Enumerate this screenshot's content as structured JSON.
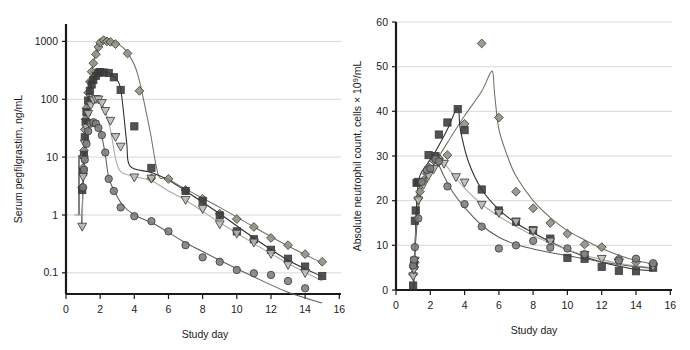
{
  "figure": {
    "panels": [
      {
        "id": "serum-pegfilgrastim",
        "ylabel": "Serum pegfilgrastim, ng/mL",
        "xlabel": "Study day",
        "yticks": [
          "1000",
          "100",
          "10",
          "1",
          "0.1"
        ],
        "xticks": [
          "0",
          "2",
          "4",
          "6",
          "8",
          "10",
          "12",
          "14",
          "16"
        ]
      },
      {
        "id": "absolute-neutrophil-count",
        "ylabel_part1": "Absolute neutrophil count, cells × 10",
        "ylabel_sup": "9",
        "ylabel_part2": "/mL",
        "xlabel": "Study day",
        "yticks": [
          "60",
          "50",
          "40",
          "30",
          "20",
          "10",
          "0"
        ],
        "xticks": [
          "0",
          "2",
          "4",
          "6",
          "8",
          "10",
          "12",
          "14",
          "16"
        ]
      }
    ]
  },
  "colors": {
    "axis": "#1a1a1a",
    "grid": "#d8d8d8",
    "series_diamond": "#8d9080",
    "series_square": "#3a3a3a",
    "series_triangle": "#b9bbb0",
    "series_circle": "#7d7d7d",
    "line_diamond": "#6f7163",
    "line_square": "#2b2b2b",
    "line_triangle": "#a8aa9e",
    "line_circle": "#5d5d5d"
  },
  "chart_data": [
    {
      "type": "scatter",
      "title": "",
      "xlabel": "Study day",
      "ylabel": "Serum pegfilgrastim, ng/mL",
      "xlim": [
        0,
        16
      ],
      "ylim": [
        0.04,
        2000
      ],
      "yscale": "log",
      "xscale": "linear",
      "grid": true,
      "legend": "none",
      "xticks": [
        0,
        2,
        4,
        6,
        8,
        10,
        12,
        14,
        16
      ],
      "yticks": [
        0.1,
        1,
        10,
        100,
        1000
      ],
      "series": [
        {
          "name": "Dose group 1 (highest) - diamond",
          "marker": "diamond",
          "color": "#8d9080",
          "points": [
            [
              0.95,
              3.0
            ],
            [
              1.0,
              6.5
            ],
            [
              1.05,
              13
            ],
            [
              1.1,
              30
            ],
            [
              1.15,
              45
            ],
            [
              1.2,
              70
            ],
            [
              1.3,
              130
            ],
            [
              1.4,
              200
            ],
            [
              1.5,
              300
            ],
            [
              1.6,
              420
            ],
            [
              1.75,
              600
            ],
            [
              1.9,
              800
            ],
            [
              2.0,
              950
            ],
            [
              2.2,
              1050
            ],
            [
              2.4,
              1000
            ],
            [
              2.6,
              980
            ],
            [
              2.9,
              900
            ],
            [
              3.6,
              620
            ],
            [
              4.3,
              140
            ],
            [
              5.0,
              4.3
            ],
            [
              6.0,
              4.2
            ],
            [
              7.0,
              2.7
            ],
            [
              8.0,
              1.9
            ],
            [
              9.0,
              1.05
            ],
            [
              10.0,
              0.85
            ],
            [
              11.0,
              0.62
            ],
            [
              12.0,
              0.4
            ],
            [
              13.0,
              0.3
            ],
            [
              14.0,
              0.21
            ],
            [
              15.0,
              0.155
            ]
          ],
          "fit_curve": "rise to ~1000 ng/mL at day 2-3, steep drop by day 5-6, then log-linear decline to 0.15"
        },
        {
          "name": "Dose group 2 - square",
          "marker": "square",
          "color": "#3a3a3a",
          "points": [
            [
              0.95,
              2.7
            ],
            [
              1.0,
              5.5
            ],
            [
              1.05,
              11
            ],
            [
              1.1,
              22
            ],
            [
              1.15,
              40
            ],
            [
              1.2,
              60
            ],
            [
              1.3,
              95
            ],
            [
              1.4,
              140
            ],
            [
              1.5,
              180
            ],
            [
              1.6,
              215
            ],
            [
              1.75,
              255
            ],
            [
              1.9,
              290
            ],
            [
              2.0,
              295
            ],
            [
              2.2,
              290
            ],
            [
              2.5,
              285
            ],
            [
              2.8,
              240
            ],
            [
              3.2,
              145
            ],
            [
              4.0,
              34
            ],
            [
              5.0,
              6.5
            ],
            [
              7.0,
              2.6
            ],
            [
              8.0,
              1.75
            ],
            [
              9.0,
              0.98
            ],
            [
              10.0,
              0.52
            ],
            [
              11.0,
              0.38
            ],
            [
              12.0,
              0.25
            ],
            [
              13.0,
              0.175
            ],
            [
              14.0,
              0.128
            ],
            [
              15.0,
              0.088
            ]
          ],
          "fit_curve": "peak ~300 ng/mL at day 2, drop after day 3, log-linear decline to 0.09"
        },
        {
          "name": "Dose group 3 - triangle",
          "marker": "triangle-down",
          "color": "#b9bbb0",
          "points": [
            [
              0.95,
              0.62
            ],
            [
              1.0,
              4.5
            ],
            [
              1.05,
              9
            ],
            [
              1.1,
              17
            ],
            [
              1.2,
              32
            ],
            [
              1.3,
              55
            ],
            [
              1.45,
              78
            ],
            [
              1.6,
              95
            ],
            [
              1.75,
              100
            ],
            [
              1.9,
              98
            ],
            [
              2.1,
              85
            ],
            [
              2.3,
              62
            ],
            [
              2.6,
              42
            ],
            [
              2.9,
              22
            ],
            [
              3.2,
              15
            ],
            [
              4.0,
              4.4
            ],
            [
              5.0,
              4.2
            ],
            [
              7.0,
              1.8
            ],
            [
              8.0,
              1.25
            ],
            [
              9.0,
              0.68
            ],
            [
              10.0,
              0.47
            ],
            [
              11.0,
              0.33
            ],
            [
              12.0,
              0.21
            ],
            [
              13.0,
              0.135
            ],
            [
              14.0,
              0.098
            ]
          ],
          "fit_curve": "peak ~100 ng/mL near day 1.8, rapid decline, log-linear tail to 0.10"
        },
        {
          "name": "Dose group 4 (lowest) - circle",
          "marker": "circle",
          "color": "#7d7d7d",
          "points": [
            [
              1.0,
              3.0
            ],
            [
              1.05,
              6.0
            ],
            [
              1.1,
              9
            ],
            [
              1.2,
              17
            ],
            [
              1.3,
              28
            ],
            [
              1.45,
              38
            ],
            [
              1.6,
              40
            ],
            [
              1.75,
              38
            ],
            [
              1.9,
              32
            ],
            [
              2.1,
              24
            ],
            [
              2.3,
              12
            ],
            [
              2.5,
              4.2
            ],
            [
              2.8,
              2.6
            ],
            [
              3.2,
              1.35
            ],
            [
              4.0,
              0.95
            ],
            [
              5.0,
              0.78
            ],
            [
              6.0,
              0.52
            ],
            [
              7.0,
              0.3
            ],
            [
              8.0,
              0.185
            ],
            [
              9.0,
              0.155
            ],
            [
              10.0,
              0.112
            ],
            [
              11.0,
              0.098
            ],
            [
              12.0,
              0.092
            ],
            [
              13.0,
              0.072
            ],
            [
              14.0,
              0.054
            ]
          ],
          "fit_curve": "peak ~40 ng/mL near day 1.6, fastest decline, log-linear tail to 0.05"
        }
      ]
    },
    {
      "type": "scatter",
      "title": "",
      "xlabel": "Study day",
      "ylabel": "Absolute neutrophil count, cells × 10⁹/mL",
      "xlim": [
        0,
        16
      ],
      "ylim": [
        0,
        60
      ],
      "yscale": "linear",
      "xscale": "linear",
      "grid": true,
      "legend": "none",
      "xticks": [
        0,
        2,
        4,
        6,
        8,
        10,
        12,
        14,
        16
      ],
      "yticks": [
        0,
        10,
        20,
        30,
        40,
        50,
        60
      ],
      "series": [
        {
          "name": "Dose group 1 (highest) - diamond",
          "marker": "diamond",
          "color": "#8d9080",
          "points": [
            [
              1.0,
              3.5
            ],
            [
              1.05,
              5.0
            ],
            [
              1.1,
              6.2
            ],
            [
              1.3,
              20.5
            ],
            [
              1.4,
              22.0
            ],
            [
              1.6,
              24.5
            ],
            [
              1.8,
              26.0
            ],
            [
              1.9,
              27.5
            ],
            [
              2.2,
              29.0
            ],
            [
              2.5,
              29.5
            ],
            [
              3.0,
              30.2
            ],
            [
              4.0,
              37.2
            ],
            [
              5.0,
              55.2
            ],
            [
              6.0,
              38.6
            ],
            [
              7.0,
              22.0
            ],
            [
              8.0,
              18.3
            ],
            [
              9.0,
              15.0
            ],
            [
              10.0,
              12.6
            ],
            [
              11.0,
              10.2
            ],
            [
              12.0,
              9.6
            ],
            [
              13.0,
              7.0
            ],
            [
              14.0,
              6.2
            ],
            [
              15.0,
              5.6
            ]
          ],
          "fit_curve": "rise from day 1, model peak ~49 at day 5.6, then decay to ~5"
        },
        {
          "name": "Dose group 2 - square",
          "marker": "square",
          "color": "#3a3a3a",
          "points": [
            [
              1.0,
              1.0
            ],
            [
              1.05,
              5.5
            ],
            [
              1.1,
              15.5
            ],
            [
              1.15,
              17.8
            ],
            [
              1.2,
              24.0
            ],
            [
              1.3,
              24.2
            ],
            [
              1.9,
              30.2
            ],
            [
              2.3,
              30.0
            ],
            [
              2.5,
              34.8
            ],
            [
              3.0,
              37.5
            ],
            [
              3.6,
              40.5
            ],
            [
              4.0,
              35.8
            ],
            [
              5.0,
              22.5
            ],
            [
              6.0,
              17.8
            ],
            [
              7.0,
              15.3
            ],
            [
              8.0,
              13.4
            ],
            [
              9.0,
              11.5
            ],
            [
              10.0,
              7.2
            ],
            [
              11.0,
              7.0
            ],
            [
              12.0,
              5.2
            ],
            [
              13.0,
              4.3
            ],
            [
              14.0,
              4.2
            ],
            [
              15.0,
              5.0
            ]
          ],
          "fit_curve": "rise steeply, model peak ~41 at day 3.7, then decay to ~4-5"
        },
        {
          "name": "Dose group 3 - triangle",
          "marker": "triangle-down",
          "color": "#b9bbb0",
          "points": [
            [
              1.0,
              3.0
            ],
            [
              1.05,
              4.5
            ],
            [
              1.1,
              6.5
            ],
            [
              1.3,
              20.0
            ],
            [
              1.6,
              23.5
            ],
            [
              1.9,
              25.5
            ],
            [
              2.2,
              27.0
            ],
            [
              2.5,
              28.5
            ],
            [
              2.8,
              28.2
            ],
            [
              3.5,
              25.2
            ],
            [
              4.0,
              24.0
            ],
            [
              5.0,
              19.0
            ],
            [
              6.0,
              17.2
            ],
            [
              7.0,
              15.2
            ],
            [
              8.0,
              13.2
            ],
            [
              9.0,
              10.8
            ],
            [
              11.0,
              7.8
            ],
            [
              12.0,
              6.9
            ],
            [
              13.0,
              6.0
            ],
            [
              15.0,
              5.2
            ]
          ],
          "fit_curve": "peak ~29 near day 2.5, gradual decline to ~5"
        },
        {
          "name": "Dose group 4 (lowest) - circle",
          "marker": "circle",
          "color": "#7d7d7d",
          "points": [
            [
              1.0,
              5.5
            ],
            [
              1.05,
              6.8
            ],
            [
              1.1,
              9.6
            ],
            [
              1.3,
              16.0
            ],
            [
              1.5,
              24.2
            ],
            [
              1.8,
              26.8
            ],
            [
              2.0,
              27.2
            ],
            [
              2.3,
              29.3
            ],
            [
              2.5,
              28.8
            ],
            [
              3.0,
              23.2
            ],
            [
              4.0,
              19.2
            ],
            [
              5.0,
              14.2
            ],
            [
              6.0,
              9.3
            ],
            [
              7.0,
              10.0
            ],
            [
              8.0,
              11.0
            ],
            [
              9.0,
              9.5
            ],
            [
              10.0,
              9.3
            ],
            [
              11.0,
              8.0
            ],
            [
              13.0,
              6.6
            ],
            [
              14.0,
              7.0
            ],
            [
              15.0,
              6.0
            ]
          ],
          "fit_curve": "peak ~29 near day 2.4, steepest early decline, tail ~6"
        }
      ]
    }
  ]
}
